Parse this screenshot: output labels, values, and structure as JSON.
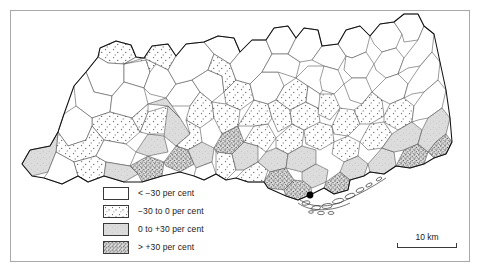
{
  "figure": {
    "type": "choropleth-map",
    "frame": {
      "visible": true,
      "color": "#a8a8a8"
    }
  },
  "legend": {
    "name": "map-legend",
    "items": [
      {
        "swatch": "class-white",
        "label": "< −30 per cent",
        "fill": "#ffffff"
      },
      {
        "swatch": "class-sparse-dots",
        "label": "−30 to 0 per cent",
        "fill": "#fbfbfb"
      },
      {
        "swatch": "class-light-grey",
        "label": "0 to +30 per cent",
        "fill": "#dcdcdc"
      },
      {
        "swatch": "class-dense-stipple",
        "label": "> +30 per cent",
        "fill": "#c4c4c4"
      }
    ]
  },
  "scale": {
    "name": "scale-bar",
    "label": "10 km"
  },
  "map": {
    "marker": {
      "name": "city-point-marker",
      "color": "#000000"
    },
    "classes": {
      "c1": "< -30 per cent",
      "c2": "-30 to 0 per cent",
      "c3": "0 to +30 per cent",
      "c4": "> +30 per cent"
    },
    "regions": [
      {
        "id": "r01",
        "cls": "c2",
        "d": "M100,48 L116,41 L131,45 L136,57 L124,64 L108,63 L98,57 Z"
      },
      {
        "id": "r02",
        "cls": "c1",
        "d": "M98,57 L108,63 L124,64 L124,82 L112,96 L94,92 L86,72 Z"
      },
      {
        "id": "r03",
        "cls": "c1",
        "d": "M124,64 L136,57 L146,60 L150,72 L144,88 L124,82 Z"
      },
      {
        "id": "r04",
        "cls": "c1",
        "d": "M86,72 L94,92 L112,96 L110,112 L92,118 L76,106 L74,86 Z"
      },
      {
        "id": "r05",
        "cls": "c1",
        "d": "M112,96 L124,82 L144,88 L148,104 L132,118 L110,112 Z"
      },
      {
        "id": "r06",
        "cls": "c2",
        "d": "M110,112 L132,118 L140,132 L126,144 L104,140 L92,126 L92,118 Z"
      },
      {
        "id": "r07",
        "cls": "c1",
        "d": "M76,106 L92,118 L92,126 L86,140 L68,146 L58,132 L64,114 Z"
      },
      {
        "id": "r08",
        "cls": "c2",
        "d": "M58,132 L68,146 L86,140 L92,126 L104,140 L96,156 L74,162 L56,152 Z"
      },
      {
        "id": "r09",
        "cls": "c3",
        "d": "M30,150 L50,146 L58,132 L56,152 L48,172 L32,176 L22,164 Z"
      },
      {
        "id": "r10",
        "cls": "c1",
        "d": "M56,152 L74,162 L78,176 L62,184 L44,178 L48,172 Z"
      },
      {
        "id": "r11",
        "cls": "c2",
        "d": "M74,162 L96,156 L106,162 L104,176 L88,182 L78,176 Z"
      },
      {
        "id": "r12",
        "cls": "c1",
        "d": "M104,140 L126,144 L136,152 L130,166 L106,162 L96,156 Z"
      },
      {
        "id": "r13",
        "cls": "c3",
        "d": "M106,162 L130,166 L138,174 L124,182 L104,176 Z"
      },
      {
        "id": "r14",
        "cls": "c4",
        "d": "M130,166 L148,156 L164,162 L162,176 L142,182 L138,174 Z"
      },
      {
        "id": "r15",
        "cls": "c3",
        "d": "M136,152 L148,134 L164,136 L168,152 L148,156 Z"
      },
      {
        "id": "r16",
        "cls": "c2",
        "d": "M140,132 L148,112 L168,106 L180,118 L172,134 L148,134 Z"
      },
      {
        "id": "r17",
        "cls": "c2",
        "d": "M132,118 L148,104 L148,112 L140,132 Z"
      },
      {
        "id": "r18",
        "cls": "c2",
        "d": "M124,64 L144,58 L156,64 L158,80 L150,72 L146,60 Z"
      },
      {
        "id": "r19",
        "cls": "c2",
        "d": "M144,58 L152,46 L168,44 L176,56 L168,70 L156,64 Z"
      },
      {
        "id": "r20",
        "cls": "c1",
        "d": "M156,64 L168,70 L176,84 L166,98 L150,94 L144,88 L150,72 Z"
      },
      {
        "id": "r21",
        "cls": "c1",
        "d": "M166,98 L176,84 L192,80 L200,92 L190,106 L172,106 Z"
      },
      {
        "id": "r22",
        "cls": "c3",
        "d": "M148,104 L166,98 L172,106 L180,118 L168,106 Z"
      },
      {
        "id": "r23",
        "cls": "c3",
        "d": "M168,106 L180,118 L190,134 L176,146 L164,136 L166,120 Z"
      },
      {
        "id": "r24",
        "cls": "c1",
        "d": "M176,56 L186,44 L204,42 L214,54 L208,70 L192,80 L176,84 L168,70 Z"
      },
      {
        "id": "r25",
        "cls": "c1",
        "d": "M192,80 L208,70 L222,76 L224,92 L212,102 L200,92 Z"
      },
      {
        "id": "r26",
        "cls": "c2",
        "d": "M200,92 L212,102 L214,118 L200,128 L186,120 L190,106 Z"
      },
      {
        "id": "r27",
        "cls": "c2",
        "d": "M186,120 L200,128 L202,142 L188,150 L176,146 L190,134 Z"
      },
      {
        "id": "r28",
        "cls": "c4",
        "d": "M176,146 L188,150 L194,164 L180,172 L166,166 L164,162 Z"
      },
      {
        "id": "r29",
        "cls": "c3",
        "d": "M188,150 L202,142 L214,148 L212,162 L196,168 L194,164 Z"
      },
      {
        "id": "r30",
        "cls": "c1",
        "d": "M196,168 L212,162 L216,174 L204,180 L194,176 Z"
      },
      {
        "id": "r31",
        "cls": "c1",
        "d": "M204,42 L218,36 L234,38 L240,52 L230,64 L214,54 Z"
      },
      {
        "id": "r32",
        "cls": "c2",
        "d": "M214,54 L230,64 L236,80 L224,92 L222,76 L208,70 Z"
      },
      {
        "id": "r33",
        "cls": "c2",
        "d": "M224,92 L236,80 L250,84 L254,100 L240,110 L226,104 Z"
      },
      {
        "id": "r34",
        "cls": "c2",
        "d": "M212,102 L226,104 L240,110 L238,126 L222,134 L214,118 Z"
      },
      {
        "id": "r35",
        "cls": "c4",
        "d": "M214,148 L222,134 L238,126 L244,142 L232,154 L216,152 Z"
      },
      {
        "id": "r36",
        "cls": "c2",
        "d": "M216,174 L216,152 L232,154 L236,170 L226,180 Z"
      },
      {
        "id": "r37",
        "cls": "c3",
        "d": "M232,154 L244,142 L258,146 L258,162 L244,170 L236,170 Z"
      },
      {
        "id": "r38",
        "cls": "c2",
        "d": "M244,170 L258,162 L268,170 L264,182 L248,182 L236,178 Z"
      },
      {
        "id": "r39",
        "cls": "c2",
        "d": "M244,142 L254,126 L268,124 L276,138 L266,152 L258,146 Z"
      },
      {
        "id": "r40",
        "cls": "c2",
        "d": "M238,126 L254,100 L268,104 L272,118 L268,124 L254,126 Z"
      },
      {
        "id": "r41",
        "cls": "c1",
        "d": "M250,84 L262,72 L278,72 L284,86 L276,100 L268,104 L254,100 Z"
      },
      {
        "id": "r42",
        "cls": "c1",
        "d": "M240,52 L252,40 L266,40 L272,54 L262,72 L250,84 L236,80 L230,64 Z"
      },
      {
        "id": "r43",
        "cls": "c1",
        "d": "M266,40 L274,28 L288,26 L296,38 L288,54 L272,54 Z"
      },
      {
        "id": "r44",
        "cls": "c1",
        "d": "M272,54 L288,54 L300,62 L296,78 L278,72 L262,72 Z"
      },
      {
        "id": "r45",
        "cls": "c2",
        "d": "M276,100 L284,86 L296,78 L308,86 L306,102 L290,110 Z"
      },
      {
        "id": "r46",
        "cls": "c2",
        "d": "M268,104 L276,100 L290,110 L292,124 L278,132 L272,118 Z"
      },
      {
        "id": "r47",
        "cls": "c2",
        "d": "M276,138 L292,124 L304,130 L302,146 L288,154 L276,148 Z"
      },
      {
        "id": "r48",
        "cls": "c3",
        "d": "M266,152 L276,148 L288,154 L286,168 L270,172 L258,162 Z"
      },
      {
        "id": "r49",
        "cls": "c4",
        "d": "M270,172 L286,168 L294,180 L284,190 L268,188 L264,182 Z"
      },
      {
        "id": "r50",
        "cls": "c4",
        "d": "M284,190 L294,180 L310,182 L312,194 L298,200 L286,196 Z"
      },
      {
        "id": "r51",
        "cls": "c3",
        "d": "M288,154 L302,146 L316,150 L316,164 L302,172 L286,168 Z"
      },
      {
        "id": "r52",
        "cls": "c3",
        "d": "M302,172 L316,164 L328,170 L326,182 L312,188 L302,180 Z"
      },
      {
        "id": "r53",
        "cls": "c2",
        "d": "M304,130 L318,122 L332,126 L334,142 L320,150 L306,144 Z"
      },
      {
        "id": "r54",
        "cls": "c2",
        "d": "M290,110 L306,102 L318,108 L320,122 L304,130 L292,124 Z"
      },
      {
        "id": "r55",
        "cls": "c1",
        "d": "M296,78 L308,66 L324,66 L330,80 L320,94 L308,86 Z"
      },
      {
        "id": "r56",
        "cls": "c1",
        "d": "M308,86 L320,94 L322,108 L318,108 L306,102 Z"
      },
      {
        "id": "r57",
        "cls": "c1",
        "d": "M288,54 L296,38 L304,28 L318,30 L322,46 L312,60 L300,62 Z"
      },
      {
        "id": "r58",
        "cls": "c1",
        "d": "M312,60 L322,46 L338,44 L346,56 L338,70 L324,66 Z"
      },
      {
        "id": "r59",
        "cls": "c1",
        "d": "M324,66 L338,70 L344,84 L334,94 L322,90 L320,80 Z"
      },
      {
        "id": "r60",
        "cls": "c2",
        "d": "M320,94 L334,94 L340,108 L330,120 L318,114 Z"
      },
      {
        "id": "r61",
        "cls": "c2",
        "d": "M332,126 L340,108 L354,110 L360,124 L348,136 L334,134 Z"
      },
      {
        "id": "r62",
        "cls": "c2",
        "d": "M334,142 L348,136 L360,142 L358,156 L344,162 L332,154 Z"
      },
      {
        "id": "r63",
        "cls": "c3",
        "d": "M344,162 L358,156 L368,164 L364,176 L350,180 L340,172 Z"
      },
      {
        "id": "r64",
        "cls": "c4",
        "d": "M326,182 L340,172 L350,180 L348,190 L334,194 L324,188 Z"
      },
      {
        "id": "r65",
        "cls": "c1",
        "d": "M338,44 L346,30 L360,26 L370,36 L366,52 L352,58 L346,56 Z"
      },
      {
        "id": "r66",
        "cls": "c1",
        "d": "M346,56 L352,58 L366,52 L374,64 L366,78 L352,78 L344,70 Z"
      },
      {
        "id": "r67",
        "cls": "c1",
        "d": "M344,84 L352,78 L366,78 L372,92 L362,104 L350,100 Z"
      },
      {
        "id": "r68",
        "cls": "c2",
        "d": "M354,110 L362,104 L372,92 L382,100 L384,116 L370,124 L360,124 Z"
      },
      {
        "id": "r69",
        "cls": "c2",
        "d": "M360,142 L370,124 L384,122 L392,134 L382,148 L368,150 Z"
      },
      {
        "id": "r70",
        "cls": "c3",
        "d": "M368,164 L382,148 L394,152 L396,166 L384,174 L370,172 Z"
      },
      {
        "id": "r71",
        "cls": "c1",
        "d": "M370,36 L380,24 L394,22 L402,34 L396,48 L382,52 L374,44 Z"
      },
      {
        "id": "r72",
        "cls": "c1",
        "d": "M374,64 L382,52 L396,48 L404,58 L398,74 L386,78 L376,70 Z"
      },
      {
        "id": "r73",
        "cls": "c1",
        "d": "M372,92 L386,78 L398,74 L408,84 L404,98 L390,104 L382,100 Z"
      },
      {
        "id": "r74",
        "cls": "c2",
        "d": "M384,116 L390,104 L404,98 L414,106 L412,122 L398,130 L384,122 Z"
      },
      {
        "id": "r75",
        "cls": "c3",
        "d": "M392,134 L398,130 L412,122 L422,130 L418,144 L404,150 L394,152 L382,148 Z"
      },
      {
        "id": "r76",
        "cls": "c4",
        "d": "M404,150 L418,144 L428,152 L424,164 L410,168 L396,166 Z"
      },
      {
        "id": "r77",
        "cls": "c1",
        "d": "M394,22 L404,14 L418,14 L424,26 L418,40 L404,42 L402,34 Z"
      },
      {
        "id": "r78",
        "cls": "c1",
        "d": "M404,58 L418,40 L424,26 L434,34 L432,52 L420,66 L408,68 L398,74 Z"
      },
      {
        "id": "r79",
        "cls": "c1",
        "d": "M408,84 L420,66 L432,52 L440,62 L438,80 L424,92 L412,94 L404,98 Z"
      },
      {
        "id": "r80",
        "cls": "c1",
        "d": "M414,106 L424,92 L438,80 L446,90 L442,108 L428,118 L418,120 L412,122 Z"
      },
      {
        "id": "r81",
        "cls": "c3",
        "d": "M422,130 L428,118 L442,108 L450,118 L446,134 L436,142 L428,152 L418,144 Z"
      },
      {
        "id": "r82",
        "cls": "c4",
        "d": "M436,142 L446,134 L452,142 L446,154 L434,158 L428,152 Z"
      }
    ]
  }
}
